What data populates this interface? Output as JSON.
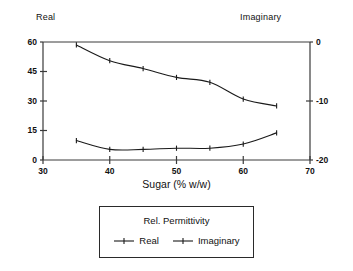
{
  "chart_data": {
    "type": "line",
    "title": "",
    "xlabel": "Sugar (% w/w)",
    "ylabel": "Real",
    "y2label": "Imaginary",
    "xlim": [
      30,
      70
    ],
    "ylim": [
      0,
      60
    ],
    "y2lim": [
      -20,
      0
    ],
    "xticks": [
      "30",
      "40",
      "50",
      "60",
      "70"
    ],
    "xtick_values": [
      30,
      40,
      50,
      60,
      70
    ],
    "yticks": [
      "0",
      "15",
      "30",
      "45",
      "60"
    ],
    "ytick_values": [
      0,
      15,
      30,
      45,
      60
    ],
    "y2ticks": [
      "-20",
      "-10",
      "0"
    ],
    "y2tick_values": [
      -20,
      -10,
      0
    ],
    "grid": false,
    "legend_position": "below-plot",
    "legend_title": "Rel. Permittivity",
    "x": [
      35,
      40,
      45,
      50,
      55,
      60,
      65
    ],
    "series": [
      {
        "name": "Real",
        "axis": "left",
        "values": [
          58.5,
          50.5,
          46.5,
          42.0,
          39.5,
          31.0,
          27.5
        ]
      },
      {
        "name": "Imaginary",
        "axis": "right",
        "values": [
          -16.7,
          -18.2,
          -18.2,
          -18.0,
          -18.0,
          -17.3,
          -15.4
        ]
      }
    ],
    "line_color": "#1a1a1a",
    "axis_color": "#3a3a3a"
  },
  "labels": {
    "left_axis_corner": "Real",
    "right_axis_corner": "Imaginary"
  },
  "legend": {
    "title": "Rel. Permittivity",
    "entries": [
      {
        "label": "Real"
      },
      {
        "label": "Imaginary"
      }
    ]
  }
}
